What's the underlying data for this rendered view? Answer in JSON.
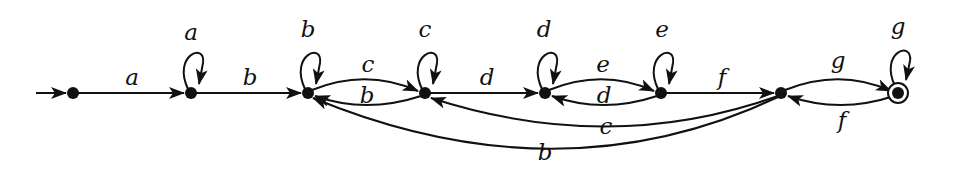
{
  "diagram": {
    "type": "finite-automaton",
    "states": [
      {
        "id": "q0",
        "x": 73,
        "y": 93,
        "start": true,
        "accepting": false
      },
      {
        "id": "q1",
        "x": 191,
        "y": 93,
        "start": false,
        "accepting": false
      },
      {
        "id": "q2",
        "x": 308,
        "y": 93,
        "start": false,
        "accepting": false
      },
      {
        "id": "q3",
        "x": 425,
        "y": 93,
        "start": false,
        "accepting": false
      },
      {
        "id": "q4",
        "x": 545,
        "y": 93,
        "start": false,
        "accepting": false
      },
      {
        "id": "q5",
        "x": 661,
        "y": 93,
        "start": false,
        "accepting": false
      },
      {
        "id": "q6",
        "x": 781,
        "y": 93,
        "start": false,
        "accepting": false
      },
      {
        "id": "q7",
        "x": 898,
        "y": 93,
        "start": false,
        "accepting": true
      }
    ],
    "transitions": [
      {
        "from": "q0",
        "to": "q1",
        "label": "a"
      },
      {
        "from": "q1",
        "to": "q1",
        "label": "a"
      },
      {
        "from": "q1",
        "to": "q2",
        "label": "b"
      },
      {
        "from": "q2",
        "to": "q2",
        "label": "b"
      },
      {
        "from": "q2",
        "to": "q3",
        "label": "c"
      },
      {
        "from": "q3",
        "to": "q2",
        "label": "b"
      },
      {
        "from": "q3",
        "to": "q3",
        "label": "c"
      },
      {
        "from": "q3",
        "to": "q4",
        "label": "d"
      },
      {
        "from": "q4",
        "to": "q4",
        "label": "d"
      },
      {
        "from": "q4",
        "to": "q5",
        "label": "e"
      },
      {
        "from": "q5",
        "to": "q4",
        "label": "d"
      },
      {
        "from": "q5",
        "to": "q5",
        "label": "e"
      },
      {
        "from": "q5",
        "to": "q6",
        "label": "f"
      },
      {
        "from": "q6",
        "to": "q3",
        "label": "c"
      },
      {
        "from": "q6",
        "to": "q2",
        "label": "b"
      },
      {
        "from": "q6",
        "to": "q7",
        "label": "g"
      },
      {
        "from": "q7",
        "to": "q6",
        "label": "f"
      },
      {
        "from": "q7",
        "to": "q7",
        "label": "g"
      }
    ],
    "labels": {
      "q0_q1": "a",
      "loop_q1": "a",
      "q1_q2": "b",
      "loop_q2": "b",
      "q2_q3": "c",
      "q3_q2": "b",
      "loop_q3": "c",
      "q3_q4": "d",
      "loop_q4": "d",
      "q4_q5": "e",
      "q5_q4": "d",
      "loop_q5": "e",
      "q5_q6": "f",
      "q6_q3": "c",
      "q6_q2": "b",
      "q6_q7": "g",
      "q7_q6": "f",
      "loop_q7": "g"
    },
    "colors": {
      "stroke": "#111111",
      "background": "#ffffff"
    }
  }
}
